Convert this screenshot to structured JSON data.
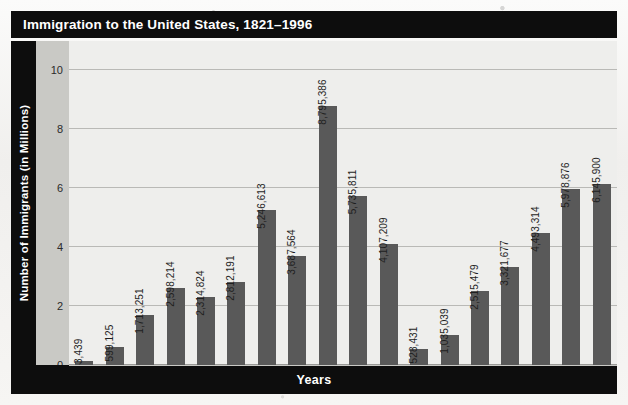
{
  "chart_data": {
    "type": "bar",
    "title": "Immigration to the United States, 1821–1996",
    "xlabel": "Years",
    "ylabel": "Number of Immigrants (in Millions)",
    "ylim": [
      0,
      11
    ],
    "yticks": [
      0,
      2,
      4,
      6,
      8,
      10
    ],
    "ytick_labels": [
      "0",
      "2",
      "4",
      "6",
      "8",
      "10"
    ],
    "grid": true,
    "legend": "none",
    "categories": [
      "1821–1830",
      "1831–1840",
      "1841–1850",
      "1851–1860",
      "1861–1870",
      "1871–1880",
      "1881–1890",
      "1891–1900",
      "1901–1910",
      "1911–1920",
      "1921–1930",
      "1931–1940",
      "1941–1950",
      "1951–1960",
      "1961–1970",
      "1971–1980",
      "1981–1990",
      "1991–1996"
    ],
    "category_lines": [
      [
        "1821–",
        "1830"
      ],
      [
        "1831–",
        "1840"
      ],
      [
        "1841–",
        "1850"
      ],
      [
        "1851–",
        "1860"
      ],
      [
        "1861–",
        "1870"
      ],
      [
        "1871–",
        "1880"
      ],
      [
        "1881–",
        "1890"
      ],
      [
        "1891–",
        "1900"
      ],
      [
        "1901–",
        "1910"
      ],
      [
        "1911–",
        "1920"
      ],
      [
        "1921–",
        "1930"
      ],
      [
        "1931–",
        "1940"
      ],
      [
        "1941–",
        "1950"
      ],
      [
        "1951–",
        "1960"
      ],
      [
        "1961–",
        "1970"
      ],
      [
        "1971–",
        "1980"
      ],
      [
        "1981–",
        "1990"
      ],
      [
        "1991–",
        "1996"
      ]
    ],
    "values": [
      143439,
      599125,
      1713251,
      2598214,
      2314824,
      2812191,
      5246613,
      3687564,
      8795386,
      5735811,
      4107209,
      528431,
      1035039,
      2515479,
      3321677,
      4493314,
      5978876,
      6145900
    ],
    "value_labels": [
      "143,439",
      "599,125",
      "1,713,251",
      "2,598,214",
      "2,314,824",
      "2,812,191",
      "5,246,613",
      "3,687,564",
      "8,795,386",
      "5,735,811",
      "4,107,209",
      "528,431",
      "1,035,039",
      "2,515,479",
      "3,321,677",
      "4,493,314",
      "5,978,876",
      "6,145,900"
    ]
  },
  "colors": {
    "title_band": "#0d0d0d",
    "title_text": "#ffffff",
    "bar": "#595959",
    "plot_background": "#eeeeec",
    "tick_strip": "#c9c9c5",
    "gridline": "#b9b9b6",
    "page_background": "#f4f3f1"
  }
}
